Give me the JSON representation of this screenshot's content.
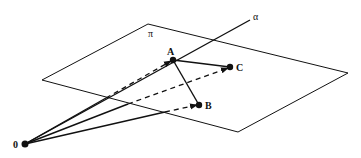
{
  "diagram": {
    "plane_label": "π",
    "line_label": "α",
    "origin_label": "0",
    "points": [
      {
        "name": "A",
        "label": "A"
      },
      {
        "name": "B",
        "label": "B"
      },
      {
        "name": "C",
        "label": "C"
      }
    ],
    "colors": {
      "stroke": "#111111",
      "background": "#ffffff"
    }
  }
}
